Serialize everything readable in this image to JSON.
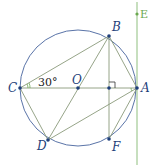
{
  "diagram": {
    "type": "geometry",
    "circle": {
      "center": "O",
      "cx": 78,
      "cy": 88,
      "r": 58,
      "color": "#3b5b9a"
    },
    "points": [
      {
        "name": "A",
        "x": 137,
        "y": 88,
        "label_dx": 5,
        "label_dy": 4
      },
      {
        "name": "B",
        "x": 109,
        "y": 36,
        "label_dx": 3,
        "label_dy": -6
      },
      {
        "name": "C",
        "x": 20,
        "y": 88,
        "label_dx": -12,
        "label_dy": 4
      },
      {
        "name": "D",
        "x": 48,
        "y": 140,
        "label_dx": -11,
        "label_dy": 8
      },
      {
        "name": "F",
        "x": 109,
        "y": 139,
        "label_dx": 3,
        "label_dy": 11
      },
      {
        "name": "O",
        "x": 78,
        "y": 88,
        "label_dx": -6,
        "label_dy": -4
      },
      {
        "name": "H",
        "x": 109,
        "y": 88,
        "label_dx": 0,
        "label_dy": 0,
        "hidden_label": true
      }
    ],
    "segments": [
      [
        "C",
        "A"
      ],
      [
        "C",
        "B"
      ],
      [
        "C",
        "D"
      ],
      [
        "B",
        "D"
      ],
      [
        "B",
        "F"
      ],
      [
        "B",
        "A"
      ],
      [
        "A",
        "F"
      ],
      [
        "A",
        "D"
      ]
    ],
    "tangent_line": {
      "x": 137,
      "y1": 2,
      "y2": 165,
      "color": "#8fbf7f",
      "point": "E",
      "ey": 14
    },
    "angle_label": {
      "text": "30°",
      "x": 36,
      "y": 86
    },
    "labels": {
      "A": "A",
      "B": "B",
      "C": "C",
      "D": "D",
      "F": "F",
      "O": "O",
      "E": "E"
    },
    "colors": {
      "line": "#8a9a7a",
      "circle": "#3b5b9a",
      "point": "#1f3f7a",
      "tangent": "#8fbf7f"
    }
  }
}
